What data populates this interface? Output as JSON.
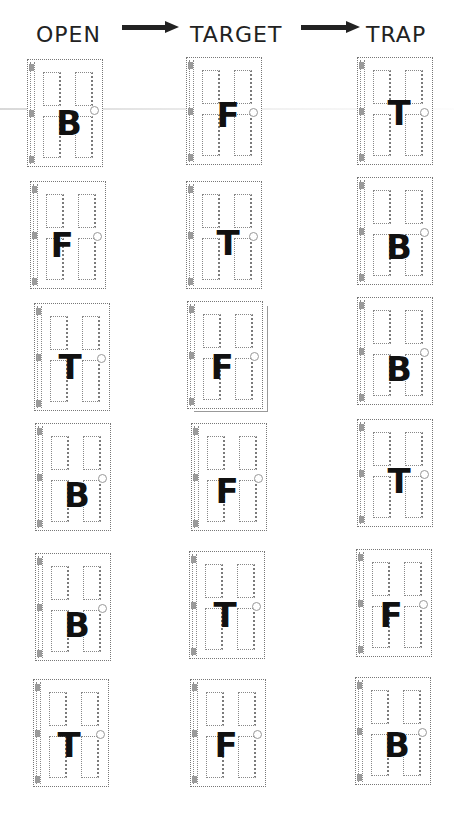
{
  "figure": {
    "columns": [
      {
        "id": "open",
        "label": "OPEN",
        "x": 27
      },
      {
        "id": "target",
        "label": "TARGET",
        "x": 186
      },
      {
        "id": "trap",
        "label": "TRAP",
        "x": 357
      }
    ],
    "arrows": [
      {
        "from": "OPEN",
        "to": "TARGET"
      },
      {
        "from": "TARGET",
        "to": "TRAP"
      }
    ],
    "rows": [
      {
        "open": "B",
        "target": "F",
        "trap": "T"
      },
      {
        "open": "F",
        "target": "T",
        "trap": "B"
      },
      {
        "open": "T",
        "target": "F",
        "trap": "B"
      },
      {
        "open": "B",
        "target": "F",
        "trap": "T"
      },
      {
        "open": "B",
        "target": "T",
        "trap": "F"
      },
      {
        "open": "T",
        "target": "F",
        "trap": "B"
      }
    ],
    "door_style": {
      "panels": 4,
      "knob_side": "right",
      "hinge_side": "left",
      "outline_color": "#777777",
      "letter_color": "#111111"
    }
  }
}
